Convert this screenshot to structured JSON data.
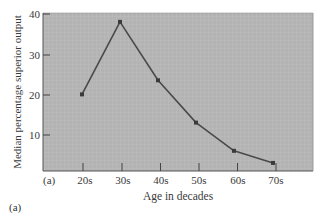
{
  "chart_data": {
    "type": "line",
    "title": "",
    "xlabel": "Age in decades",
    "ylabel": "Median percentage superior output",
    "categories": [
      "20s",
      "30s",
      "40s",
      "50s",
      "60s",
      "70s"
    ],
    "values": [
      20,
      38,
      23.5,
      13,
      6,
      3
    ],
    "series": [
      {
        "name": "Median percentage superior output",
        "values": [
          20,
          38,
          23.5,
          13,
          6,
          3
        ]
      }
    ],
    "yticks": [
      10,
      20,
      30,
      40
    ],
    "ylim": [
      0,
      40
    ],
    "grid": true,
    "legend": null,
    "annotations": [
      "(a)"
    ]
  },
  "axis": {
    "x_title": "Age in decades",
    "y_title": "Median percentage superior output",
    "x_ticks": [
      "20s",
      "30s",
      "40s",
      "50s",
      "60s",
      "70s"
    ],
    "y_ticks": [
      "10",
      "20",
      "30",
      "40"
    ],
    "corner_label": "(a)"
  },
  "panel_label": "(a)",
  "colors": {
    "plot_background": "#b3b3b3",
    "line": "#4a4a4a",
    "marker": "#3a3a3a",
    "text": "#3a3a3a"
  }
}
